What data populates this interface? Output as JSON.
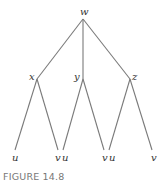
{
  "figure": {
    "caption": "FIGURE 14.8"
  },
  "tree": {
    "root": {
      "label": "w"
    },
    "internal": [
      {
        "label": "x"
      },
      {
        "label": "y"
      },
      {
        "label": "z"
      }
    ],
    "leaves": [
      {
        "label": "u"
      },
      {
        "label": "v"
      },
      {
        "label": "u"
      },
      {
        "label": "v"
      },
      {
        "label": "u"
      },
      {
        "label": "v"
      }
    ]
  },
  "colors": {
    "edge": "#7a7a7a",
    "label": "#333333",
    "caption": "#777777"
  }
}
